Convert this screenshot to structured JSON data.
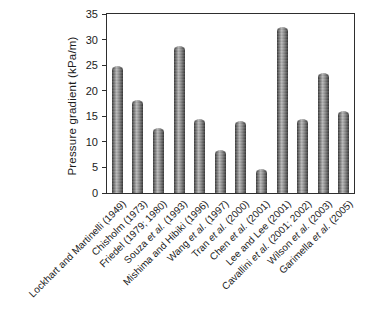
{
  "chart_data": {
    "type": "bar",
    "title": "",
    "xlabel": "",
    "ylabel": "Pressure gradient (kPa/m)",
    "ylim": [
      0,
      35
    ],
    "yticks": [
      0,
      5,
      10,
      15,
      20,
      25,
      30,
      35
    ],
    "grid": false,
    "legend": null,
    "plot_border": "full-box",
    "bar_style": {
      "appearance": "gray-cylinder-gradient",
      "fill_light": "#b6b6b6",
      "fill_dark": "#3c3c3c",
      "axis_color": "#2e2e2e"
    },
    "categories": [
      "Lockhart and Martinelli (1949)",
      "Chisholm (1973)",
      "Friedel (1979; 1980)",
      "Souza et al. (1993)",
      "Mishima and Hibiki (1996)",
      "Wang et al. (1997)",
      "Tran et al. (2000)",
      "Chen et al. (2001)",
      "Lee and Lee (2001)",
      "Cavallini et al. (2001; 2002)",
      "Wilson et al. (2003)",
      "Garimella et al. (2005)"
    ],
    "values": [
      24.8,
      18.2,
      12.8,
      28.8,
      14.5,
      8.5,
      14.0,
      4.8,
      32.5,
      14.5,
      23.5,
      16.0
    ],
    "italic_token": "et al.",
    "x_tick_rotation_deg": 45
  }
}
